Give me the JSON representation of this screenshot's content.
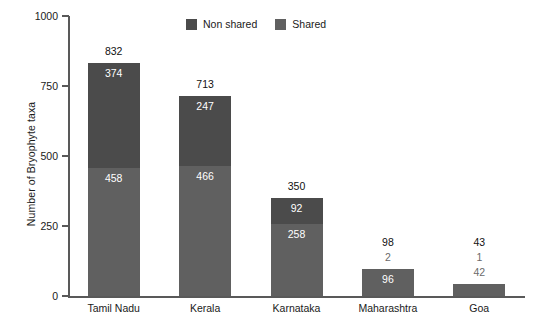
{
  "chart_data": {
    "type": "bar",
    "subtype": "stacked-bar",
    "title": "",
    "xlabel": "",
    "ylabel": "Number of Bryophyte taxa",
    "ylim": [
      0,
      1000
    ],
    "yticks": [
      0,
      250,
      500,
      750,
      1000
    ],
    "ytick_labels": [
      "0",
      "250",
      "500",
      "750",
      "1000"
    ],
    "grid": false,
    "legend_position": "top-center",
    "categories": [
      "Tamil Nadu",
      "Kerala",
      "Karnataka",
      "Maharashtra",
      "Goa"
    ],
    "series": [
      {
        "name": "Non shared",
        "color": "#4b4b4b",
        "values": [
          374,
          247,
          92,
          2,
          1
        ]
      },
      {
        "name": "Shared",
        "color": "#606060",
        "values": [
          458,
          466,
          258,
          96,
          42
        ]
      }
    ],
    "totals": [
      832,
      713,
      350,
      98,
      43
    ],
    "total_labels": [
      "832",
      "713",
      "350",
      "98",
      "43"
    ],
    "bars": [
      {
        "category": "Tamil Nadu",
        "total": 832,
        "total_label": "832",
        "nonshared": 374,
        "nonshared_label": "374",
        "nonshared_label_inside": true,
        "shared": 458,
        "shared_label": "458",
        "shared_label_inside": true
      },
      {
        "category": "Kerala",
        "total": 713,
        "total_label": "713",
        "nonshared": 247,
        "nonshared_label": "247",
        "nonshared_label_inside": true,
        "shared": 466,
        "shared_label": "466",
        "shared_label_inside": true
      },
      {
        "category": "Karnataka",
        "total": 350,
        "total_label": "350",
        "nonshared": 92,
        "nonshared_label": "92",
        "nonshared_label_inside": true,
        "shared": 258,
        "shared_label": "258",
        "shared_label_inside": true
      },
      {
        "category": "Maharashtra",
        "total": 98,
        "total_label": "98",
        "nonshared": 2,
        "nonshared_label": "2",
        "nonshared_label_inside": false,
        "shared": 96,
        "shared_label": "96",
        "shared_label_inside": true
      },
      {
        "category": "Goa",
        "total": 43,
        "total_label": "43",
        "nonshared": 1,
        "nonshared_label": "1",
        "nonshared_label_inside": false,
        "shared": 42,
        "shared_label": "42",
        "shared_label_inside": false
      }
    ]
  },
  "legend": {
    "items": [
      {
        "label": "Non shared",
        "color": "#4b4b4b"
      },
      {
        "label": "Shared",
        "color": "#606060"
      }
    ]
  },
  "axes": {
    "y_title": "Number of Bryophyte taxa",
    "y_tick_labels": [
      "1000",
      "750",
      "500",
      "250",
      "0"
    ],
    "x_tick_labels": [
      "Tamil Nadu",
      "Kerala",
      "Karnataka",
      "Maharashtra",
      "Goa"
    ]
  },
  "colors": {
    "nonshared": "#4b4b4b",
    "shared": "#606060",
    "axis": "#595959",
    "text": "#1a1a1a",
    "muted_text": "#6a6a6a",
    "inside_label": "#ffffff",
    "background": "#ffffff"
  }
}
